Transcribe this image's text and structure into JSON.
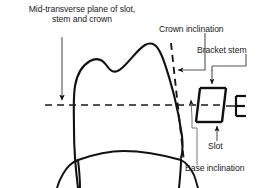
{
  "figure": {
    "type": "anatomical-diagram",
    "background_color": "#ffffff",
    "stroke_color": "#111111"
  },
  "labels": {
    "mid_transverse_line1": "Mid-transverse plane of slot,",
    "mid_transverse_line2": "stem and crown",
    "crown_inclination": "Crown inclination",
    "bracket_stem": "Bracket stem",
    "slot": "Slot",
    "base_inclination": "Base inclination"
  },
  "elements": {
    "tooth_outline_name": "molar-crown-outline",
    "mid_transverse_plane_style": "dashed horizontal line",
    "crown_tangent_style": "dashed inclined line",
    "bracket_name": "bracket-trapezoid-body",
    "slot_name": "bracket-slot-opening"
  },
  "colors": {
    "ink": "#111111",
    "dash": "#1a1a1a",
    "leader": "#555555"
  }
}
